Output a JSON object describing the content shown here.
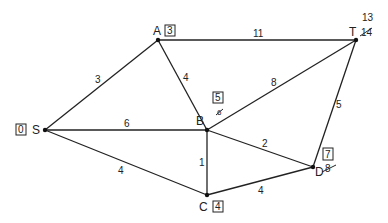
{
  "diagram": {
    "type": "weighted-graph-shortest-path",
    "nodes": [
      {
        "id": "S",
        "label": "S",
        "final": "0",
        "x": 45,
        "y": 130
      },
      {
        "id": "A",
        "label": "A",
        "final": "3",
        "x": 158,
        "y": 40
      },
      {
        "id": "T",
        "label": "T",
        "final": "13",
        "crossed": "14",
        "x": 356,
        "y": 40
      },
      {
        "id": "B",
        "label": "B",
        "final": "5",
        "crossed": "6",
        "x": 207,
        "y": 130
      },
      {
        "id": "C",
        "label": "C",
        "final": "4",
        "x": 207,
        "y": 195
      },
      {
        "id": "D",
        "label": "D",
        "final": "7",
        "crossed": "8",
        "x": 313,
        "y": 167
      }
    ],
    "edges": [
      {
        "from": "S",
        "to": "A",
        "weight": "3"
      },
      {
        "from": "A",
        "to": "T",
        "weight": "11"
      },
      {
        "from": "A",
        "to": "B",
        "weight": "4"
      },
      {
        "from": "S",
        "to": "B",
        "weight": "6"
      },
      {
        "from": "S",
        "to": "C",
        "weight": "4"
      },
      {
        "from": "B",
        "to": "T",
        "weight": "8"
      },
      {
        "from": "B",
        "to": "C",
        "weight": "1"
      },
      {
        "from": "B",
        "to": "D",
        "weight": "2"
      },
      {
        "from": "C",
        "to": "D",
        "weight": "4"
      },
      {
        "from": "D",
        "to": "T",
        "weight": "5"
      }
    ]
  }
}
